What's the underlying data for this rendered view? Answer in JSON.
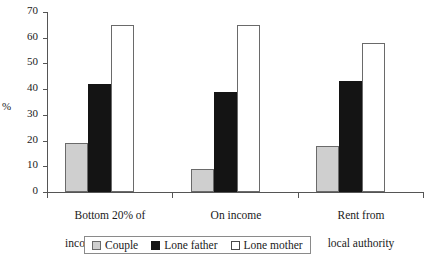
{
  "chart_data": {
    "type": "bar",
    "title": "",
    "xlabel": "",
    "ylabel": "%",
    "ylim": [
      0,
      70
    ],
    "yticks": [
      0,
      10,
      20,
      30,
      40,
      50,
      60,
      70
    ],
    "grid": false,
    "legend_position": "bottom",
    "categories": [
      "Bottom 20% of\nincome distribution",
      "On income\nsupport",
      "Rent from\nlocal authority"
    ],
    "series": [
      {
        "name": "Couple",
        "color": "#cfcfcf",
        "values": [
          19,
          9,
          18
        ]
      },
      {
        "name": "Lone father",
        "color": "#141414",
        "values": [
          42,
          39,
          43
        ]
      },
      {
        "name": "Lone mother",
        "color": "#ffffff",
        "values": [
          65,
          65,
          58
        ]
      }
    ]
  },
  "axis": {
    "y_label": "%",
    "y_tick_labels": [
      "70",
      "60",
      "50",
      "40",
      "30",
      "20",
      "10",
      "0"
    ]
  },
  "legend": {
    "items": [
      {
        "label": "Couple",
        "swatch": "swatch-couple-icon"
      },
      {
        "label": "Lone father",
        "swatch": "swatch-lone-father-icon"
      },
      {
        "label": "Lone mother",
        "swatch": "swatch-lone-mother-icon"
      }
    ]
  },
  "groups": [
    {
      "line1": "Bottom 20% of",
      "line2": "income distribution"
    },
    {
      "line1": "On income",
      "line2": "support"
    },
    {
      "line1": "Rent from",
      "line2": "local authority"
    }
  ]
}
